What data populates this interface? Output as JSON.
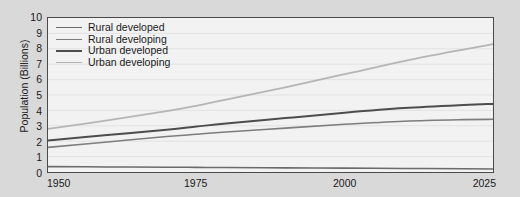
{
  "chart_data": {
    "type": "line",
    "title": "",
    "xlabel": "",
    "ylabel": "Population (Billions)",
    "xlim": [
      1950,
      2025
    ],
    "ylim": [
      0,
      10
    ],
    "grid": true,
    "legend_position": "top-left",
    "x_ticks": [
      "1950",
      "1975",
      "2000",
      "2025"
    ],
    "x_tick_values": [
      1950,
      1975,
      2000,
      2025
    ],
    "y_ticks": [
      "0",
      "1",
      "2",
      "3",
      "4",
      "5",
      "6",
      "7",
      "8",
      "9",
      "10"
    ],
    "y_tick_values": [
      0,
      1,
      2,
      3,
      4,
      5,
      6,
      7,
      8,
      9,
      10
    ],
    "x": [
      1950,
      1960,
      1970,
      1975,
      1980,
      1990,
      2000,
      2010,
      2020,
      2025
    ],
    "series": [
      {
        "name": "Rural developed",
        "color": "#6b6b6b",
        "width": 1.6,
        "values": [
          0.35,
          0.33,
          0.31,
          0.3,
          0.29,
          0.27,
          0.25,
          0.23,
          0.21,
          0.2
        ]
      },
      {
        "name": "Rural developing",
        "color": "#7d7d7d",
        "width": 1.6,
        "values": [
          1.6,
          1.95,
          2.3,
          2.45,
          2.6,
          2.85,
          3.1,
          3.3,
          3.4,
          3.42
        ]
      },
      {
        "name": "Urban developed",
        "color": "#4d4d4d",
        "width": 2.0,
        "values": [
          2.05,
          2.4,
          2.75,
          2.95,
          3.15,
          3.5,
          3.85,
          4.15,
          4.35,
          4.42
        ]
      },
      {
        "name": "Urban developing",
        "color": "#b5b5b5",
        "width": 1.8,
        "values": [
          2.8,
          3.35,
          3.95,
          4.3,
          4.7,
          5.5,
          6.35,
          7.2,
          7.95,
          8.3
        ]
      }
    ]
  },
  "legend": {
    "items": [
      {
        "label": "Rural developed",
        "color": "#6b6b6b",
        "width": 1.6
      },
      {
        "label": "Rural developing",
        "color": "#7d7d7d",
        "width": 1.6
      },
      {
        "label": "Urban developed",
        "color": "#4d4d4d",
        "width": 2.0
      },
      {
        "label": "Urban developing",
        "color": "#b5b5b5",
        "width": 1.8
      }
    ]
  },
  "style": {
    "page_background": "#d9d9d9",
    "plot_background": "#f2f2f2",
    "axis_color": "#4a4a4a",
    "grid_color": "#e2e2e2",
    "text_color": "#1a1a1a"
  }
}
